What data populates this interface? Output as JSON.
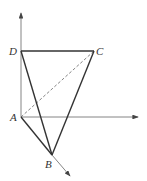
{
  "diagram": {
    "type": "3d-geometry-tetrahedron",
    "points": {
      "A": {
        "label": "A",
        "x": 21,
        "y": 117
      },
      "B": {
        "label": "B",
        "x": 52,
        "y": 155
      },
      "C": {
        "label": "C",
        "x": 94,
        "y": 51
      },
      "D": {
        "label": "D",
        "x": 21,
        "y": 51
      }
    },
    "solid_edges": [
      "AD",
      "DC",
      "DB",
      "CB",
      "AB"
    ],
    "dashed_edges": [
      "AC"
    ],
    "axes": [
      {
        "name": "vertical-axis",
        "from": [
          21,
          117
        ],
        "to": [
          21,
          12
        ]
      },
      {
        "name": "horizontal-axis",
        "from": [
          21,
          117
        ],
        "to": [
          139,
          117
        ]
      },
      {
        "name": "diagonal-axis",
        "from": [
          52,
          155
        ],
        "to": [
          71,
          177
        ]
      }
    ]
  }
}
